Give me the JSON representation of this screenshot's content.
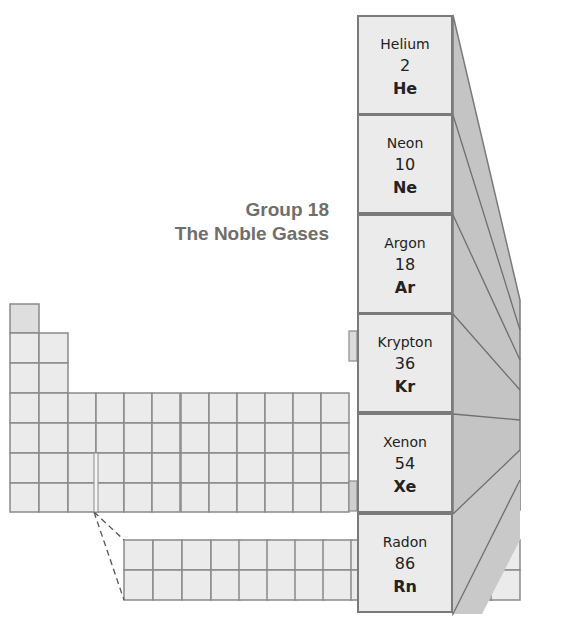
{
  "diagram": {
    "title_line1": "Group 18",
    "title_line2": "The Noble Gases",
    "group_number": 18,
    "elements": [
      {
        "name": "Helium",
        "number": "2",
        "symbol": "He"
      },
      {
        "name": "Neon",
        "number": "10",
        "symbol": "Ne"
      },
      {
        "name": "Argon",
        "number": "18",
        "symbol": "Ar"
      },
      {
        "name": "Krypton",
        "number": "36",
        "symbol": "Kr"
      },
      {
        "name": "Xenon",
        "number": "54",
        "symbol": "Xe"
      },
      {
        "name": "Radon",
        "number": "86",
        "symbol": "Rn"
      }
    ],
    "colors": {
      "cell_fill": "#ebebeb",
      "grid_line": "#8a8a8a",
      "highlight_fill": "#d9d9d9",
      "extrusion_fill": "#c4c4c4",
      "title_color": "#6e6e6e"
    }
  }
}
